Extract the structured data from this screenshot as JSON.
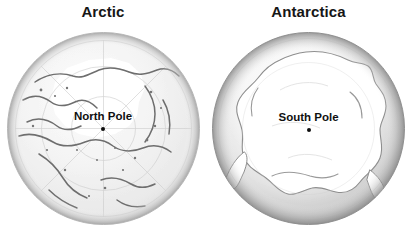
{
  "figure": {
    "background_color": "#ffffff",
    "panel_count": 2
  },
  "panels": [
    {
      "key": "arctic",
      "title": "Arctic",
      "pole_label": "North Pole",
      "pole_marker": "pole-dot",
      "projection": "polar azimuthal",
      "globe": {
        "body_color": "#f2f2f2",
        "edge_color": "#c9c9c9",
        "ice_cap_color": "#ffffff",
        "coastline_color": "#6a6a6a",
        "graticule_color": "#bfbfbf"
      }
    },
    {
      "key": "antarctica",
      "title": "Antarctica",
      "pole_label": "South Pole",
      "pole_marker": "pole-dot",
      "projection": "polar azimuthal",
      "globe": {
        "body_color": "#ffffff",
        "edge_color": "#a3a3a3",
        "ice_cap_color": "#ffffff",
        "coastline_color": "#8c8c8c",
        "graticule_color": "#d0d0d0"
      }
    }
  ],
  "colors": {
    "title_text": "#161616",
    "label_text": "#101010",
    "marker": "#0d0d0d",
    "background": "#ffffff"
  }
}
